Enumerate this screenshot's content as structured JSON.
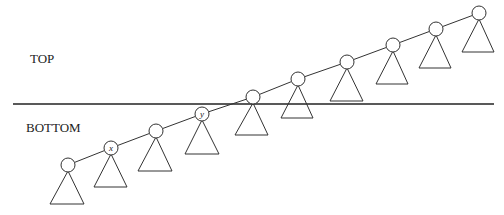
{
  "labels": {
    "top": "TOP",
    "bottom": "BOTTOM"
  },
  "divider": {
    "y": 104,
    "x1": 13,
    "x2": 494
  },
  "nodes": [
    {
      "x": 68,
      "y": 165,
      "r": 7,
      "label": "",
      "tri": {
        "left": 50,
        "right": 84,
        "base": 204
      }
    },
    {
      "x": 111,
      "y": 148,
      "r": 7,
      "label": "x",
      "tri": {
        "left": 94,
        "right": 127,
        "base": 187
      }
    },
    {
      "x": 156,
      "y": 131,
      "r": 7,
      "label": "",
      "tri": {
        "left": 138,
        "right": 172,
        "base": 171
      }
    },
    {
      "x": 202,
      "y": 114,
      "r": 7,
      "label": "y",
      "tri": {
        "left": 185,
        "right": 219,
        "base": 154
      }
    },
    {
      "x": 253,
      "y": 97,
      "r": 7,
      "label": "",
      "tri": {
        "left": 235,
        "right": 268,
        "base": 135
      }
    },
    {
      "x": 298,
      "y": 79,
      "r": 7,
      "label": "",
      "tri": {
        "left": 281,
        "right": 313,
        "base": 118
      }
    },
    {
      "x": 347,
      "y": 62,
      "r": 7,
      "label": "",
      "tri": {
        "left": 330,
        "right": 363,
        "base": 101
      }
    },
    {
      "x": 393,
      "y": 45,
      "r": 7,
      "label": "",
      "tri": {
        "left": 376,
        "right": 408,
        "base": 84
      }
    },
    {
      "x": 436,
      "y": 29,
      "r": 7,
      "label": "",
      "tri": {
        "left": 419,
        "right": 451,
        "base": 68
      }
    },
    {
      "x": 479,
      "y": 13,
      "r": 7,
      "label": "",
      "tri": {
        "left": 462,
        "right": 494,
        "base": 52
      }
    }
  ],
  "colors": {
    "stroke": "#333333",
    "divider": "#222222",
    "background": "#ffffff"
  }
}
